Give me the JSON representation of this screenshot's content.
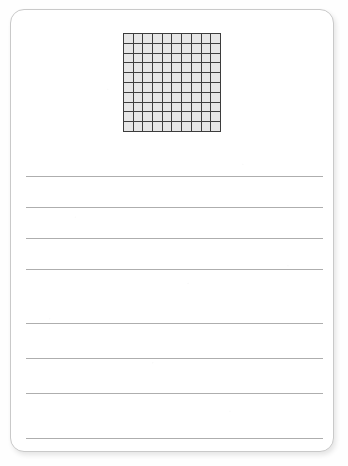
{
  "document": {
    "type": "worksheet-card",
    "background_color": "#ffffff",
    "card": {
      "border_color": "#c9c9c9",
      "corner_radius_px": 14,
      "shadow": true
    },
    "grid": {
      "name": "hundredths-grid",
      "columns": 10,
      "rows": 10,
      "total_cells": 100,
      "cell_fill_color": "#e6e6e6",
      "line_color": "#3d3d3d",
      "shaded_cells": 0,
      "left_px": 122,
      "top_px": 32,
      "width_px": 98,
      "height_px": 99
    },
    "writing_lines": {
      "name": "ruled-lines",
      "count": 8,
      "color": "#aeaeae",
      "left_px": 25,
      "right_px": 322,
      "y_positions_px": [
        175,
        206,
        237,
        268,
        322,
        357,
        392,
        437
      ]
    }
  }
}
